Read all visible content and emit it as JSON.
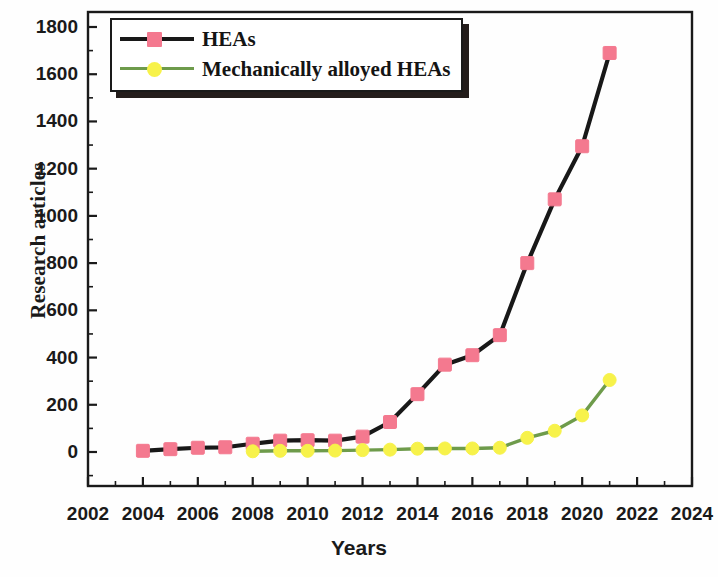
{
  "chart_data": {
    "type": "line",
    "title": "",
    "xlabel": "Years",
    "ylabel": "Research articles",
    "xlim": [
      2002,
      2024
    ],
    "ylim": [
      0,
      1800
    ],
    "xticks": [
      2002,
      2004,
      2006,
      2008,
      2010,
      2012,
      2014,
      2016,
      2018,
      2020,
      2022,
      2024
    ],
    "xtick_labels": [
      "2002",
      "2004",
      "2006",
      "2008",
      "2010",
      "2012",
      "2014",
      "2016",
      "2018",
      "2020",
      "2022",
      "2024"
    ],
    "x_minor_tick_step": 1,
    "yticks": [
      0,
      200,
      400,
      600,
      800,
      1000,
      1200,
      1400,
      1600,
      1800
    ],
    "ytick_labels": [
      "0",
      "200",
      "400",
      "600",
      "800",
      "1000",
      "1200",
      "1400",
      "1600",
      "1800"
    ],
    "y_minor_tick_step": 100,
    "grid": false,
    "legend_position": "top-left",
    "series": [
      {
        "name": "HEAs",
        "line_color": "#181818",
        "marker_color": "#F4798F",
        "marker_edge_color": "#F4798F",
        "marker": "square",
        "x": [
          2004,
          2005,
          2006,
          2007,
          2008,
          2009,
          2010,
          2011,
          2012,
          2013,
          2014,
          2015,
          2016,
          2017,
          2018,
          2019,
          2020,
          2021
        ],
        "values": [
          5,
          12,
          18,
          20,
          35,
          48,
          50,
          48,
          65,
          127,
          245,
          370,
          410,
          495,
          800,
          1070,
          1295,
          1690
        ]
      },
      {
        "name": "Mechanically alloyed HEAs",
        "line_color": "#6E9B4B",
        "marker_color": "#F7F24A",
        "marker_edge_color": "#F7F24A",
        "marker": "circle",
        "x": [
          2008,
          2009,
          2010,
          2011,
          2012,
          2013,
          2014,
          2015,
          2016,
          2017,
          2018,
          2019,
          2020,
          2021
        ],
        "values": [
          3,
          5,
          5,
          6,
          8,
          10,
          14,
          15,
          15,
          18,
          60,
          90,
          155,
          305
        ]
      }
    ]
  },
  "legend": {
    "items": [
      {
        "label": "HEAs"
      },
      {
        "label": "Mechanically alloyed HEAs"
      }
    ]
  }
}
